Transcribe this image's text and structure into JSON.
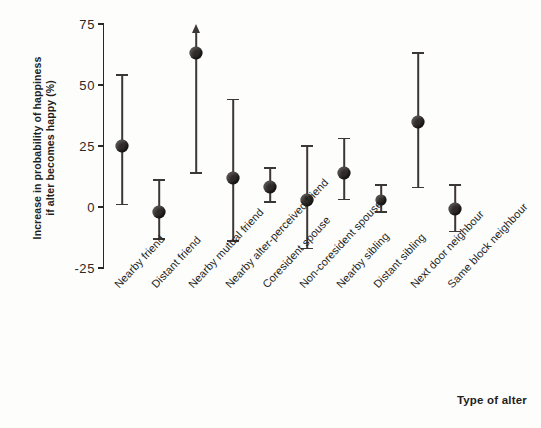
{
  "chart_data": {
    "type": "scatter",
    "title": "",
    "xlabel": "Type of alter",
    "ylabel_line1": "Increase in probability of happiness",
    "ylabel_line2": "if alter becomes happy (%)",
    "ylim": [
      -25,
      75
    ],
    "yticks": [
      75,
      50,
      25,
      0,
      -25
    ],
    "ytick_labels": [
      "75",
      "50",
      "25",
      "0",
      "-25"
    ],
    "grid": false,
    "legend": "none",
    "marker_color": "#2f2b29",
    "errorbar_color": "#3b3734",
    "axis_color": "#2b2725",
    "categories": [
      "Nearby friend",
      "Distant friend",
      "Nearby mutual friend",
      "Nearby alter-perceived friend",
      "Coresident spouse",
      "Non-coresident spouse",
      "Nearby sibling",
      "Distant sibling",
      "Next door neighbour",
      "Same block neighbour"
    ],
    "values": [
      25,
      -2,
      63,
      12,
      8,
      3,
      14,
      3,
      35,
      -1
    ],
    "ci_lower": [
      1,
      -13,
      14,
      -14,
      2,
      -17,
      3,
      -2,
      8,
      -10
    ],
    "ci_upper": [
      54,
      11,
      78,
      44,
      16,
      25,
      28,
      9,
      63,
      9
    ],
    "upper_truncated": [
      false,
      false,
      true,
      false,
      false,
      false,
      false,
      false,
      false,
      false
    ],
    "annotations": [
      "arrow indicates confidence interval extends beyond plotted range for Nearby mutual friend"
    ]
  }
}
